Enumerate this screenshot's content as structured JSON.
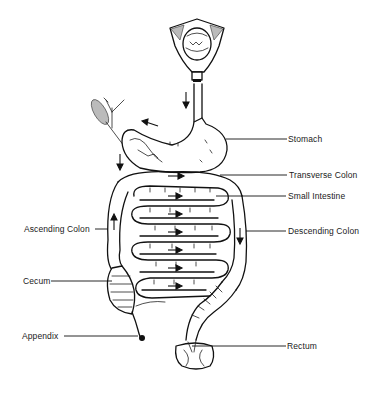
{
  "diagram": {
    "labels": {
      "stomach": "Stomach",
      "transverse_colon": "Transverse Colon",
      "small_intestine": "Small Intestine",
      "ascending_colon": "Ascending Colon",
      "descending_colon": "Descending Colon",
      "cecum": "Cecum",
      "appendix": "Appendix",
      "rectum": "Rectum"
    },
    "caption": "Figure — The digestive tract: the path of food from the mouth through the stomach, small intestine and colon"
  }
}
